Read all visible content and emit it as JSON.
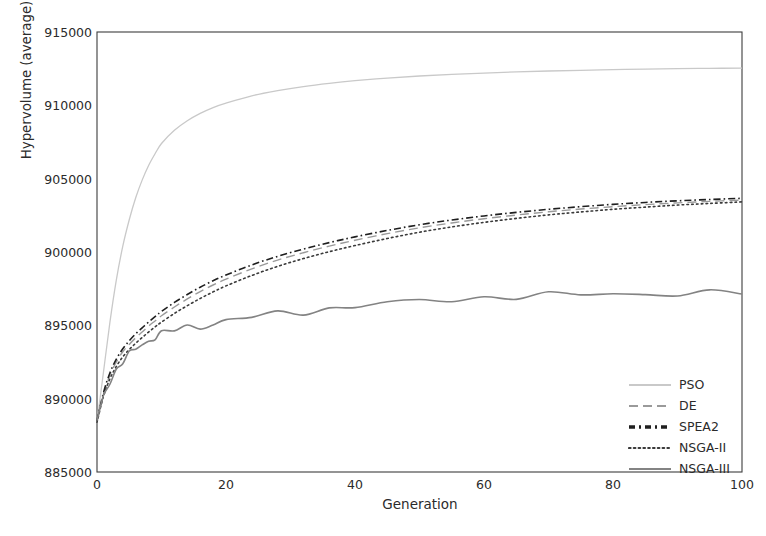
{
  "chart_data": {
    "type": "line",
    "title": "",
    "xlabel": "Generation",
    "ylabel": "Hypervolume (average)",
    "xlim": [
      0,
      100
    ],
    "ylim": [
      885000,
      915000
    ],
    "xticks": [
      0,
      20,
      40,
      60,
      80,
      100
    ],
    "yticks": [
      885000,
      890000,
      895000,
      900000,
      905000,
      910000,
      915000
    ],
    "xtick_labels": [
      "0",
      "20",
      "40",
      "60",
      "80",
      "100"
    ],
    "ytick_labels": [
      "885000",
      "890000",
      "895000",
      "900000",
      "905000",
      "910000",
      "915000"
    ],
    "grid": false,
    "legend_position": "lower-right-inside",
    "x": [
      0,
      1,
      2,
      3,
      4,
      5,
      6,
      7,
      8,
      9,
      10,
      12,
      14,
      16,
      18,
      20,
      24,
      28,
      32,
      36,
      40,
      45,
      50,
      55,
      60,
      65,
      70,
      75,
      80,
      85,
      90,
      95,
      100
    ],
    "series": [
      {
        "name": "PSO",
        "color": "#c9c9c9",
        "dash": "solid",
        "width": 1.3,
        "values": [
          888400,
          891800,
          895200,
          898100,
          900400,
          902200,
          903700,
          904900,
          905900,
          906700,
          907400,
          908300,
          908950,
          909450,
          909850,
          910150,
          910650,
          911000,
          911280,
          911500,
          911680,
          911860,
          912000,
          912110,
          912200,
          912280,
          912340,
          912390,
          912430,
          912470,
          912500,
          912520,
          912540
        ]
      },
      {
        "name": "DE",
        "color": "#9a9a9a",
        "dash": "dashed",
        "width": 1.4,
        "values": [
          888450,
          890300,
          891600,
          892500,
          893200,
          893700,
          894150,
          894550,
          894950,
          895300,
          895650,
          896250,
          896800,
          897300,
          897750,
          898150,
          898850,
          899450,
          899950,
          900400,
          900800,
          901250,
          901650,
          901980,
          902270,
          902520,
          902740,
          902930,
          903090,
          903230,
          903350,
          903450,
          903540
        ]
      },
      {
        "name": "SPEA2",
        "color": "#1f1f1f",
        "dash": "dashdot",
        "width": 1.6,
        "values": [
          888500,
          890400,
          891750,
          892700,
          893400,
          893950,
          894420,
          894830,
          895230,
          895600,
          895950,
          896560,
          897100,
          897600,
          898040,
          898430,
          899120,
          899700,
          900200,
          900640,
          901030,
          901470,
          901860,
          902180,
          902460,
          902700,
          902910,
          903090,
          903250,
          903380,
          903490,
          903580,
          903660
        ]
      },
      {
        "name": "NSGA-II",
        "color": "#3a3a3a",
        "dash": "dotted",
        "width": 1.6,
        "values": [
          888400,
          890150,
          891350,
          892200,
          892850,
          893350,
          893780,
          894170,
          894540,
          894890,
          895220,
          895810,
          896340,
          896830,
          897280,
          897690,
          898400,
          899020,
          899550,
          900020,
          900440,
          900920,
          901350,
          901710,
          902020,
          902290,
          902530,
          902730,
          902910,
          903060,
          903200,
          903310,
          903420
        ]
      },
      {
        "name": "NSGA-III",
        "color": "#838383",
        "dash": "solid",
        "width": 1.6,
        "values": [
          888400,
          890100,
          891200,
          891950,
          892550,
          893000,
          893380,
          893700,
          893960,
          894180,
          894380,
          894700,
          894880,
          894940,
          895080,
          895280,
          895560,
          895780,
          895960,
          896130,
          896300,
          896480,
          896640,
          896780,
          896890,
          896980,
          897040,
          897090,
          897130,
          897160,
          897180,
          897200,
          897210
        ]
      }
    ]
  },
  "legend": {
    "items": [
      {
        "label": "PSO"
      },
      {
        "label": "DE"
      },
      {
        "label": "SPEA2"
      },
      {
        "label": "NSGA-II"
      },
      {
        "label": "NSGA-III"
      }
    ]
  },
  "colors": {
    "axis": "#3d3d3d",
    "text": "#2b2b2b",
    "background": "#ffffff"
  }
}
